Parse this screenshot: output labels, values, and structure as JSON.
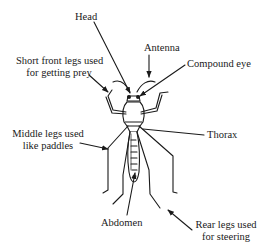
{
  "diagram": {
    "labels": {
      "head": "Head",
      "antenna": "Antenna",
      "compound_eye": "Compound eye",
      "front_legs": [
        "Short front legs used",
        "for getting prey"
      ],
      "middle_legs": [
        "Middle legs used",
        "like paddles"
      ],
      "thorax": "Thorax",
      "abdomen": "Abdomen",
      "rear_legs": [
        "Rear legs used",
        "for steering"
      ]
    },
    "colors": {
      "line": "#1a1a1a",
      "background": "#ffffff"
    }
  }
}
